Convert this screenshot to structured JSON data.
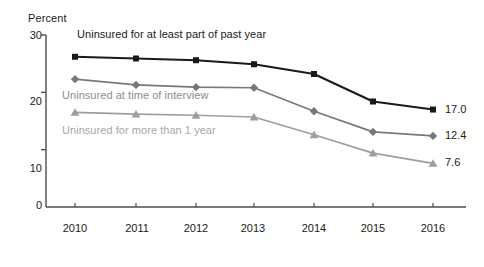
{
  "chart_data": {
    "type": "line",
    "title": "",
    "xlabel": "",
    "ylabel": "Percent",
    "categories": [
      "2010",
      "2011",
      "2012",
      "2013",
      "2014",
      "2015",
      "2016"
    ],
    "ylim": [
      0,
      30
    ],
    "yticks": [
      "0",
      "10",
      "20",
      "30"
    ],
    "ytick_values": [
      0,
      10,
      20,
      30
    ],
    "grid": false,
    "legend_position": "inline-annotations",
    "series": [
      {
        "name": "Uninsured for at least part of past year",
        "marker": "square",
        "color": "#1a1a1a",
        "values": [
          26.2,
          25.9,
          25.6,
          24.9,
          23.2,
          18.4,
          17.0
        ],
        "end_label": "17.0"
      },
      {
        "name": "Uninsured at time of interview",
        "marker": "diamond",
        "color": "#787878",
        "values": [
          22.3,
          21.3,
          20.9,
          20.8,
          16.7,
          13.1,
          12.4
        ],
        "end_label": "12.4"
      },
      {
        "name": "Uninsured for more than 1 year",
        "marker": "triangle",
        "color": "#9e9e9e",
        "values": [
          16.5,
          16.2,
          16.0,
          15.7,
          12.6,
          9.4,
          7.6
        ],
        "end_label": "7.6"
      }
    ]
  },
  "axes": {
    "y_axis_title": "Percent",
    "y_tick_30": "30",
    "y_tick_20": "20",
    "y_tick_10": "10",
    "y_tick_0": "0",
    "x_tick_2010": "2010",
    "x_tick_2011": "2011",
    "x_tick_2012": "2012",
    "x_tick_2013": "2013",
    "x_tick_2014": "2014",
    "x_tick_2015": "2015",
    "x_tick_2016": "2016"
  },
  "annotations": {
    "series1_label": "Uninsured for at least part of past year",
    "series2_label": "Uninsured at time of interview",
    "series3_label": "Uninsured for more than 1 year",
    "series1_end_value": "17.0",
    "series2_end_value": "12.4",
    "series3_end_value": "7.6"
  },
  "colors": {
    "series1": "#1a1a1a",
    "series2": "#787878",
    "series3": "#9e9e9e",
    "axis": "#4d4d4d",
    "text": "#1a1a1a",
    "background": "#ffffff"
  }
}
